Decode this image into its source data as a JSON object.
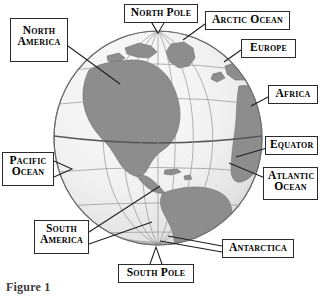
{
  "figure": {
    "caption": "Figure 1",
    "colors": {
      "land": "#8e8e8e",
      "ocean": "#f1f1f1",
      "grid": "#9a9a9a",
      "outline": "#6e6e6e",
      "label_border": "#2b2b2b",
      "label_text": "#000000",
      "leader_line": "#1e1e1e",
      "background": "#ffffff"
    }
  },
  "labels": [
    {
      "id": "north-pole",
      "name": "North Pole",
      "lines": [
        "North Pole"
      ],
      "x": 124,
      "y": 4,
      "w": 74,
      "h": 19
    },
    {
      "id": "arctic-ocean",
      "name": "Arctic Ocean",
      "lines": [
        "Arctic Ocean"
      ],
      "x": 205,
      "y": 11,
      "w": 85,
      "h": 19
    },
    {
      "id": "europe",
      "name": "Europe",
      "lines": [
        "Europe"
      ],
      "x": 241,
      "y": 39,
      "w": 55,
      "h": 19
    },
    {
      "id": "africa",
      "name": "Africa",
      "lines": [
        "Africa"
      ],
      "x": 270,
      "y": 85,
      "w": 50,
      "h": 19
    },
    {
      "id": "equator",
      "name": "Equator",
      "lines": [
        "Equator"
      ],
      "x": 267,
      "y": 136,
      "w": 53,
      "h": 19
    },
    {
      "id": "atlantic-ocean",
      "name": "Atlantic Ocean",
      "lines": [
        "Atlantic",
        "Ocean"
      ],
      "x": 265,
      "y": 167,
      "w": 55,
      "h": 33
    },
    {
      "id": "north-america",
      "name": "North America",
      "lines": [
        "North",
        "America"
      ],
      "x": 10,
      "y": 18,
      "w": 58,
      "h": 44
    },
    {
      "id": "pacific-ocean",
      "name": "Pacific Ocean",
      "lines": [
        "Pacific",
        "Ocean"
      ],
      "x": 2,
      "y": 152,
      "w": 52,
      "h": 34
    },
    {
      "id": "south-america",
      "name": "South America",
      "lines": [
        "South",
        "America"
      ],
      "x": 34,
      "y": 220,
      "w": 55,
      "h": 34
    },
    {
      "id": "antarctica",
      "name": "Antarctica",
      "lines": [
        "Antarctica"
      ],
      "x": 222,
      "y": 239,
      "w": 72,
      "h": 19
    },
    {
      "id": "south-pole",
      "name": "South Pole",
      "lines": [
        "South Pole"
      ],
      "x": 118,
      "y": 264,
      "w": 76,
      "h": 19
    }
  ],
  "globe": {
    "center_x": 158,
    "center_y": 138,
    "radius_x": 105,
    "radius_y": 108,
    "equator_y": 160,
    "features": [
      "North America",
      "South America",
      "Greenland",
      "Europe",
      "Africa",
      "Antarctica"
    ]
  }
}
